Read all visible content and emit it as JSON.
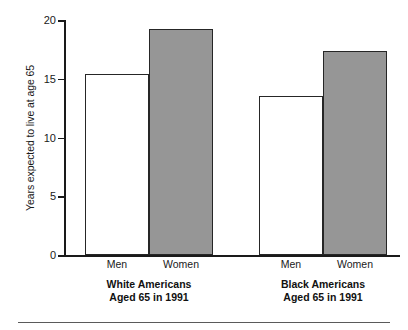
{
  "chart_data": {
    "type": "bar",
    "title": "",
    "subtitle": "",
    "xlabel": "",
    "ylabel": "Years expected to live at age 65",
    "ylim": [
      0,
      20
    ],
    "yticks": [
      0,
      5,
      10,
      15,
      20
    ],
    "ytick_labels": [
      "0",
      "5",
      "10",
      "15",
      "20"
    ],
    "grid": false,
    "legend": "none",
    "categories": [
      "Men",
      "Women"
    ],
    "groups": [
      {
        "name": "White Americans",
        "caption_line1": "White Americans",
        "caption_line2": "Aged 65 in 1991",
        "bars": [
          {
            "label": "Men",
            "value": 15.4,
            "style": "open"
          },
          {
            "label": "Women",
            "value": 19.2,
            "style": "filled"
          }
        ]
      },
      {
        "name": "Black Americans",
        "caption_line1": "Black Americans",
        "caption_line2": "Aged 65 in 1991",
        "bars": [
          {
            "label": "Men",
            "value": 13.5,
            "style": "open"
          },
          {
            "label": "Women",
            "value": 17.4,
            "style": "filled"
          }
        ]
      }
    ],
    "series": [
      {
        "name": "Men",
        "values": [
          15.4,
          13.5
        ]
      },
      {
        "name": "Women",
        "values": [
          19.2,
          17.4
        ]
      }
    ],
    "colors": {
      "open_bar_fill": "#ffffff",
      "filled_bar_fill": "#969696",
      "bar_outline": "#262626",
      "axis": "#1a1a1a",
      "text": "#1a1a1a"
    }
  },
  "axis": {
    "ytick_0": "0",
    "ytick_1": "5",
    "ytick_2": "10",
    "ytick_3": "15",
    "ytick_4": "20",
    "ylabel": "Years expected to live at age 65"
  },
  "labels": {
    "white_men": "Men",
    "white_women": "Women",
    "black_men": "Men",
    "black_women": "Women",
    "white_group_line1": "White Americans",
    "white_group_line2": "Aged 65 in 1991",
    "black_group_line1": "Black Americans",
    "black_group_line2": "Aged 65 in 1991"
  }
}
